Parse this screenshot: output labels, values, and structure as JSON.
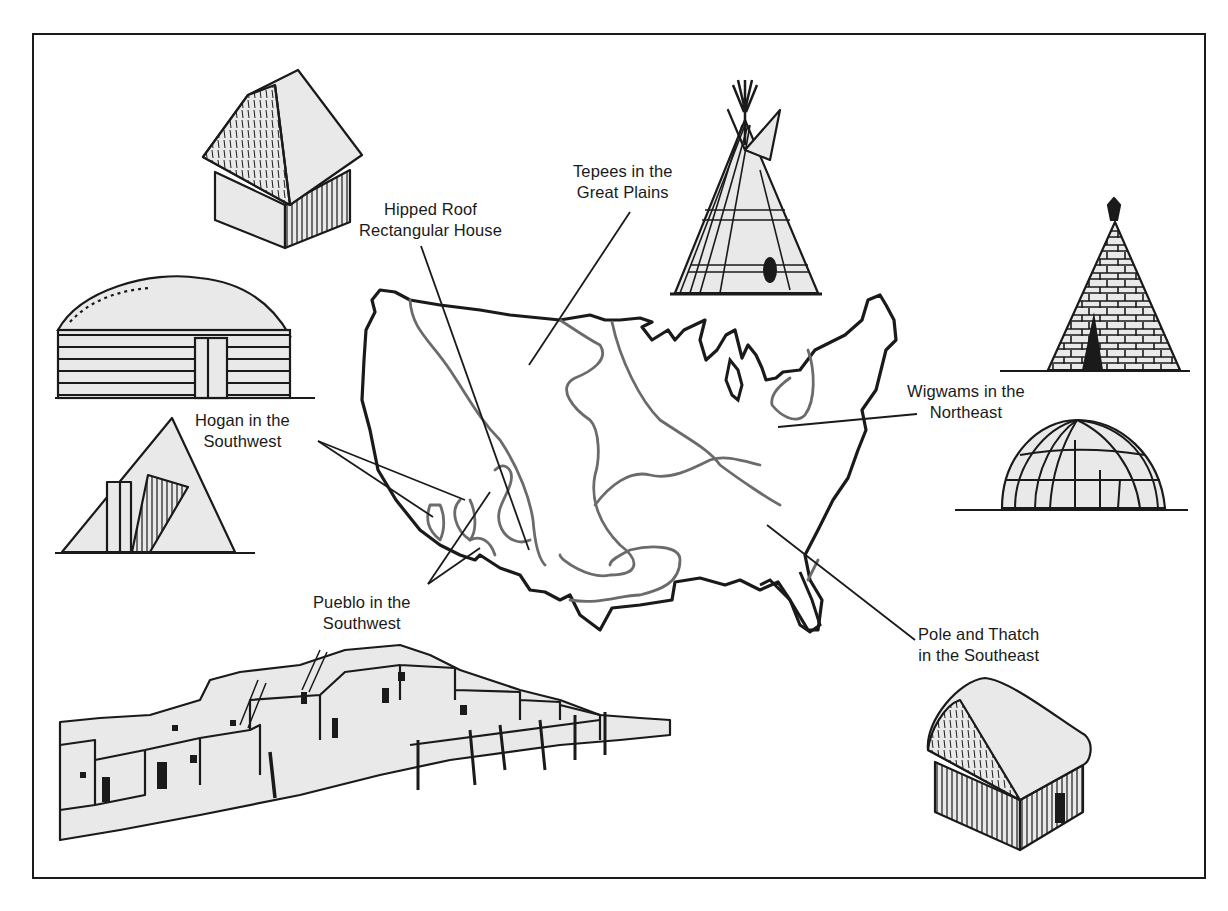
{
  "figure": {
    "colors": {
      "ink": "#1a1a1a",
      "region_boundary": "#6b6b6b",
      "fill": "#e9e9e9",
      "background": "#ffffff"
    }
  },
  "labels": {
    "hipped_roof": {
      "line1": "Hipped Roof",
      "line2": "Rectangular House"
    },
    "tepees": {
      "line1": "Tepees in the",
      "line2": "Great Plains"
    },
    "wigwams": {
      "line1": "Wigwams in the",
      "line2": "Northeast"
    },
    "hogan": {
      "line1": "Hogan in the",
      "line2": "Southwest"
    },
    "pueblo": {
      "line1": "Pueblo in the",
      "line2": "Southwest"
    },
    "pole_thatch": {
      "line1": "Pole and Thatch",
      "line2": "in the Southeast"
    }
  },
  "illustrations": [
    {
      "id": "hipped-roof-house",
      "depicts": "thatched hipped-roof rectangular house"
    },
    {
      "id": "hogan-log",
      "depicts": "log hogan with earth-covered dome roof"
    },
    {
      "id": "hogan-forked",
      "depicts": "forked-stick conical hogan with entry"
    },
    {
      "id": "pueblo",
      "depicts": "multi-storey adobe pueblo village with ladders"
    },
    {
      "id": "tepee-plains",
      "depicts": "plains tepee with poles and smoke flaps"
    },
    {
      "id": "tepee-bark",
      "depicts": "bark-covered conical tepee"
    },
    {
      "id": "wigwam",
      "depicts": "domed wigwam with bent-sapling frame"
    },
    {
      "id": "pole-thatch-house",
      "depicts": "thatched pole house with arched roof"
    }
  ]
}
